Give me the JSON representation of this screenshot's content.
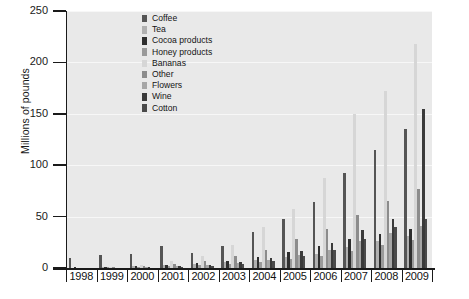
{
  "chart_data": {
    "type": "bar",
    "title": "",
    "xlabel": "",
    "ylabel": "Millions of pounds",
    "ylim": [
      0,
      250
    ],
    "yticks": [
      0,
      50,
      100,
      150,
      200,
      250
    ],
    "grid": true,
    "legend_position": "top-center-inside",
    "categories": [
      "1998",
      "1999",
      "2000",
      "2001",
      "2002",
      "2003",
      "2004",
      "2005",
      "2006",
      "2007",
      "2008",
      "2009"
    ],
    "series": [
      {
        "name": "Coffee",
        "color": "#555555",
        "values": [
          10,
          13,
          14,
          21,
          15,
          21,
          35,
          48,
          64,
          92,
          115,
          135
        ]
      },
      {
        "name": "Tea",
        "color": "#b0b0b0",
        "values": [
          0,
          1,
          2,
          3,
          4,
          6,
          8,
          11,
          14,
          20,
          26,
          31
        ]
      },
      {
        "name": "Cocoa products",
        "color": "#2e2e2e",
        "values": [
          1,
          1,
          2,
          3,
          5,
          7,
          11,
          16,
          21,
          28,
          33,
          38
        ]
      },
      {
        "name": "Honey products",
        "color": "#9a9a9a",
        "values": [
          0,
          1,
          1,
          2,
          3,
          4,
          6,
          9,
          12,
          17,
          22,
          27
        ]
      },
      {
        "name": "Bananas",
        "color": "#d6d6d6",
        "values": [
          0,
          1,
          3,
          7,
          12,
          22,
          40,
          57,
          88,
          150,
          172,
          218
        ]
      },
      {
        "name": "Other",
        "color": "#8c8c8c",
        "values": [
          0,
          1,
          2,
          4,
          7,
          12,
          18,
          28,
          38,
          52,
          65,
          77
        ]
      },
      {
        "name": "Flowers",
        "color": "#a6a6a6",
        "values": [
          0,
          0,
          1,
          2,
          3,
          5,
          8,
          13,
          18,
          26,
          34,
          41
        ]
      },
      {
        "name": "Wine",
        "color": "#3a3a3a",
        "values": [
          0,
          0,
          1,
          2,
          3,
          6,
          10,
          17,
          24,
          37,
          48,
          155
        ]
      },
      {
        "name": "Cotton",
        "color": "#4a4a4a",
        "values": [
          0,
          0,
          0,
          1,
          2,
          4,
          7,
          12,
          18,
          28,
          40,
          48
        ]
      }
    ]
  },
  "axes": {
    "y_tick_labels": [
      "250",
      "200",
      "150",
      "100",
      "50",
      "0"
    ],
    "y_axis_title": "Millions of pounds"
  },
  "legend": {
    "items": [
      {
        "label": "Coffee",
        "color": "#555555"
      },
      {
        "label": "Tea",
        "color": "#b0b0b0"
      },
      {
        "label": "Cocoa products",
        "color": "#2e2e2e"
      },
      {
        "label": "Honey products",
        "color": "#9a9a9a"
      },
      {
        "label": "Bananas",
        "color": "#d6d6d6"
      },
      {
        "label": "Other",
        "color": "#8c8c8c"
      },
      {
        "label": "Flowers",
        "color": "#a6a6a6"
      },
      {
        "label": "Wine",
        "color": "#3a3a3a"
      },
      {
        "label": "Cotton",
        "color": "#4a4a4a"
      }
    ]
  },
  "colors": {
    "plot_background": "#e9e9e9",
    "gridline": "#f7f7f7",
    "axis": "#1a1a1a",
    "page_background": "#ffffff"
  }
}
